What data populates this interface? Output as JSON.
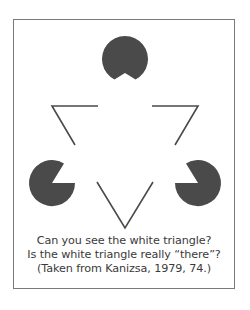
{
  "figure": {
    "colors": {
      "fill": "#4a4a4a",
      "stroke": "#4a4a4a",
      "frame": "#7a7a7a",
      "background": "#ffffff",
      "text": "#3a3a3a"
    },
    "inducers": [
      {
        "name": "top",
        "cx": 125,
        "cy": 59,
        "r": 23
      },
      {
        "name": "left",
        "cx": 52,
        "cy": 183,
        "r": 23
      },
      {
        "name": "right",
        "cx": 198,
        "cy": 183,
        "r": 23
      }
    ],
    "outline_corners": [
      {
        "name": "top-left-angle"
      },
      {
        "name": "top-right-angle"
      },
      {
        "name": "bottom-v"
      }
    ]
  },
  "caption": {
    "line1": "Can you see the white triangle?",
    "line2": "Is the white triangle really “there”?",
    "line3": "(Taken from Kanizsa, 1979, 74.)"
  }
}
